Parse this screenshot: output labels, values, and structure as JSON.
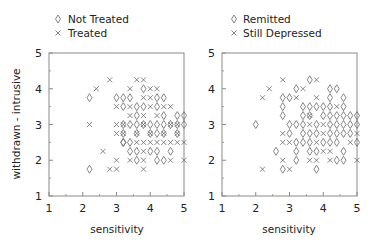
{
  "chart_data": [
    {
      "type": "scatter",
      "panel": "left",
      "title": "",
      "xlabel": "sensitivity",
      "ylabel": "withdrawn - intrusive",
      "xlim": [
        1,
        5
      ],
      "ylim": [
        1,
        5
      ],
      "xticks": [
        "1",
        "2",
        "3",
        "4",
        "5"
      ],
      "yticks": [
        "1",
        "2",
        "3",
        "4",
        "5"
      ],
      "grid": false,
      "legend_position": "top",
      "legend": [
        {
          "marker": "diamond",
          "label": "Not Treated"
        },
        {
          "marker": "x",
          "label": "Treated"
        }
      ],
      "series": [
        {
          "name": "Not Treated",
          "marker": "diamond",
          "points": [
            [
              2.2,
              3.75
            ],
            [
              2.2,
              1.75
            ],
            [
              3.0,
              3.75
            ],
            [
              3.2,
              3.5
            ],
            [
              3.6,
              3.25
            ],
            [
              3.8,
              3.5
            ],
            [
              4.4,
              3.75
            ],
            [
              4.0,
              3.0
            ],
            [
              4.4,
              2.75
            ],
            [
              3.2,
              2.5
            ],
            [
              4.8,
              2.75
            ],
            [
              3.6,
              2.25
            ],
            [
              4.2,
              2.25
            ],
            [
              4.6,
              2.25
            ],
            [
              3.6,
              2.0
            ],
            [
              4.2,
              2.0
            ],
            [
              4.4,
              2.0
            ],
            [
              3.2,
              3.75
            ],
            [
              3.2,
              3.0
            ],
            [
              3.4,
              3.0
            ],
            [
              3.6,
              3.0
            ],
            [
              3.8,
              3.0
            ],
            [
              4.2,
              3.0
            ],
            [
              4.4,
              3.0
            ],
            [
              4.6,
              3.0
            ],
            [
              4.8,
              3.0
            ],
            [
              3.4,
              3.75
            ],
            [
              3.8,
              4.0
            ],
            [
              4.2,
              3.75
            ],
            [
              3.6,
              3.5
            ],
            [
              4.2,
              3.5
            ],
            [
              4.8,
              3.25
            ],
            [
              4.4,
              3.25
            ],
            [
              3.2,
              2.75
            ],
            [
              3.6,
              2.75
            ],
            [
              4.0,
              2.75
            ],
            [
              4.2,
              2.75
            ],
            [
              3.2,
              2.5
            ],
            [
              3.4,
              2.5
            ],
            [
              4.0,
              2.25
            ],
            [
              3.4,
              2.25
            ],
            [
              5.0,
              3.25
            ],
            [
              5.0,
              3.0
            ]
          ]
        },
        {
          "name": "Treated",
          "marker": "x",
          "points": [
            [
              2.8,
              4.25
            ],
            [
              3.6,
              4.25
            ],
            [
              3.8,
              4.25
            ],
            [
              2.4,
              4.0
            ],
            [
              3.4,
              4.0
            ],
            [
              4.0,
              4.0
            ],
            [
              4.2,
              4.0
            ],
            [
              3.8,
              3.75
            ],
            [
              3.0,
              3.5
            ],
            [
              3.4,
              3.5
            ],
            [
              4.0,
              3.5
            ],
            [
              4.4,
              3.5
            ],
            [
              4.6,
              3.5
            ],
            [
              3.4,
              3.25
            ],
            [
              3.8,
              3.25
            ],
            [
              4.2,
              3.25
            ],
            [
              2.2,
              3.0
            ],
            [
              3.0,
              3.0
            ],
            [
              3.2,
              3.0
            ],
            [
              3.8,
              3.0
            ],
            [
              4.6,
              3.0
            ],
            [
              3.0,
              2.75
            ],
            [
              3.2,
              2.75
            ],
            [
              3.6,
              2.75
            ],
            [
              4.0,
              2.75
            ],
            [
              4.4,
              2.75
            ],
            [
              4.8,
              2.75
            ],
            [
              3.6,
              2.5
            ],
            [
              3.8,
              2.5
            ],
            [
              4.0,
              2.5
            ],
            [
              4.2,
              2.5
            ],
            [
              4.4,
              2.5
            ],
            [
              4.6,
              2.5
            ],
            [
              4.8,
              2.5
            ],
            [
              5.0,
              2.5
            ],
            [
              2.6,
              2.25
            ],
            [
              3.8,
              2.25
            ],
            [
              3.0,
              2.0
            ],
            [
              3.4,
              2.0
            ],
            [
              3.8,
              2.0
            ],
            [
              4.6,
              2.0
            ],
            [
              5.0,
              2.0
            ],
            [
              2.8,
              1.75
            ],
            [
              3.0,
              1.75
            ],
            [
              3.8,
              1.75
            ],
            [
              4.0,
              3.75
            ],
            [
              4.8,
              3.0
            ]
          ]
        }
      ]
    },
    {
      "type": "scatter",
      "panel": "right",
      "title": "",
      "xlabel": "sensitivity",
      "ylabel": "",
      "xlim": [
        1,
        5
      ],
      "ylim": [
        1,
        5
      ],
      "xticks": [
        "1",
        "2",
        "3",
        "4",
        "5"
      ],
      "yticks": [
        "1",
        "2",
        "3",
        "4",
        "5"
      ],
      "grid": false,
      "legend_position": "top",
      "legend": [
        {
          "marker": "diamond",
          "label": "Remitted"
        },
        {
          "marker": "x",
          "label": "Still Depressed"
        }
      ],
      "series": [
        {
          "name": "Remitted",
          "marker": "diamond",
          "points": [
            [
              3.6,
              4.25
            ],
            [
              3.2,
              4.0
            ],
            [
              4.2,
              4.0
            ],
            [
              4.4,
              4.0
            ],
            [
              2.8,
              3.75
            ],
            [
              3.0,
              3.75
            ],
            [
              4.2,
              3.75
            ],
            [
              4.6,
              3.75
            ],
            [
              2.8,
              3.5
            ],
            [
              3.4,
              3.5
            ],
            [
              3.6,
              3.5
            ],
            [
              3.8,
              3.5
            ],
            [
              4.0,
              3.5
            ],
            [
              4.2,
              3.5
            ],
            [
              4.6,
              3.5
            ],
            [
              2.8,
              3.25
            ],
            [
              3.4,
              3.25
            ],
            [
              3.6,
              3.25
            ],
            [
              4.0,
              3.25
            ],
            [
              4.2,
              3.25
            ],
            [
              4.4,
              3.25
            ],
            [
              4.6,
              3.25
            ],
            [
              4.8,
              3.25
            ],
            [
              5.0,
              3.25
            ],
            [
              2.0,
              3.0
            ],
            [
              3.0,
              3.0
            ],
            [
              3.2,
              3.0
            ],
            [
              3.4,
              3.0
            ],
            [
              3.8,
              3.0
            ],
            [
              4.2,
              3.0
            ],
            [
              4.4,
              3.0
            ],
            [
              4.6,
              3.0
            ],
            [
              4.8,
              3.0
            ],
            [
              5.0,
              3.0
            ],
            [
              3.0,
              2.75
            ],
            [
              3.4,
              2.75
            ],
            [
              3.6,
              2.75
            ],
            [
              3.8,
              2.75
            ],
            [
              4.2,
              2.75
            ],
            [
              4.4,
              2.75
            ],
            [
              4.6,
              2.75
            ],
            [
              4.8,
              2.75
            ],
            [
              3.2,
              2.5
            ],
            [
              3.4,
              2.5
            ],
            [
              3.6,
              2.5
            ],
            [
              4.0,
              2.5
            ],
            [
              4.2,
              2.5
            ],
            [
              4.4,
              2.5
            ],
            [
              5.0,
              2.5
            ],
            [
              2.6,
              2.25
            ],
            [
              3.2,
              2.25
            ],
            [
              3.6,
              2.25
            ],
            [
              3.8,
              2.25
            ],
            [
              4.6,
              2.25
            ],
            [
              3.2,
              2.0
            ],
            [
              4.4,
              2.0
            ],
            [
              4.6,
              2.0
            ],
            [
              2.8,
              1.75
            ],
            [
              3.8,
              1.75
            ]
          ]
        },
        {
          "name": "Still Depressed",
          "marker": "x",
          "points": [
            [
              2.8,
              4.25
            ],
            [
              3.8,
              4.25
            ],
            [
              2.4,
              4.0
            ],
            [
              3.4,
              4.0
            ],
            [
              2.2,
              3.75
            ],
            [
              3.2,
              3.75
            ],
            [
              3.8,
              3.75
            ],
            [
              4.4,
              3.5
            ],
            [
              3.6,
              3.25
            ],
            [
              3.6,
              3.0
            ],
            [
              4.0,
              3.0
            ],
            [
              2.8,
              2.75
            ],
            [
              4.0,
              2.75
            ],
            [
              5.0,
              2.75
            ],
            [
              2.8,
              2.5
            ],
            [
              3.0,
              2.5
            ],
            [
              3.8,
              2.5
            ],
            [
              4.8,
              2.5
            ],
            [
              4.0,
              2.25
            ],
            [
              4.2,
              2.25
            ],
            [
              2.8,
              2.0
            ],
            [
              3.6,
              2.0
            ],
            [
              3.8,
              2.0
            ],
            [
              4.2,
              2.0
            ],
            [
              5.0,
              2.0
            ],
            [
              2.2,
              1.75
            ],
            [
              3.0,
              1.75
            ]
          ]
        }
      ]
    }
  ],
  "legend_left": {
    "item1": "Not Treated",
    "item2": "Treated"
  },
  "legend_right": {
    "item1": "Remitted",
    "item2": "Still Depressed"
  },
  "axes": {
    "xlabel": "sensitivity",
    "ylabel": "withdrawn - intrusive",
    "ticks": [
      "1",
      "2",
      "3",
      "4",
      "5"
    ]
  },
  "colors": {
    "axis": "#8a8a8a",
    "marker": "#6a6a6a",
    "text": "#222222"
  }
}
